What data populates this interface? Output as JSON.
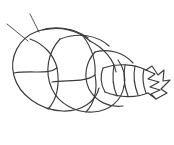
{
  "page": {
    "title": "Snail shell line drawing",
    "subject": "spiral snail shell",
    "style": "black and white line art coloring page",
    "width": 174,
    "height": 145
  },
  "colors": {
    "background": "#ffffff",
    "line": "#3b3b3b",
    "line_light": "#4a4a4a",
    "fill": "#ffffff"
  },
  "drawing": {
    "bounds": {
      "x": 5,
      "y": 14,
      "width": 163,
      "height": 101
    },
    "parts": [
      {
        "name": "antenna-upper",
        "description": "thin tendril from top of shell angling up-right"
      },
      {
        "name": "antenna-lower",
        "description": "thin tendril from upper-left of shell angling up-left"
      },
      {
        "name": "outer-whorl",
        "description": "large rounded left whorl of the shell"
      },
      {
        "name": "second-whorl",
        "description": "overlapping middle spiral band"
      },
      {
        "name": "third-whorl",
        "description": "inner spiral band to the right"
      },
      {
        "name": "tapering-tube",
        "description": "narrow segmented tube tapering to the right"
      },
      {
        "name": "jagged-opening",
        "description": "zigzag toothed opening at the right tip"
      }
    ],
    "segment_line_count": 12,
    "zigzag_tooth_count": 5,
    "antenna_count": 2
  },
  "geometry": {
    "antenna_upper": "M 39 32 L 30 14",
    "antenna_lower": "M 28 41 L 7 24",
    "outer_whorl": "M 38 31 C 18 38 9 58 14 76 C 19 95 40 110 62 111 C 82 112 96 101 99 88",
    "outer_whorl_back": "M 38 31 C 55 25 75 28 88 38",
    "whorl_seg_1": "M 30 39 C 44 44 54 55 57 68",
    "whorl_seg_2": "M 14 73 C 32 70 48 75 57 68",
    "whorl_seg_3": "M 57 68 C 60 84 57 100 48 109",
    "whorl_top_arc": "M 43 30 C 60 26 78 30 90 41",
    "band2_outer": "M 60 39 C 48 52 44 72 52 89 C 59 104 76 113 93 112 C 110 111 122 100 124 86",
    "band2_inner": "M 90 41 C 104 48 114 60 116 72",
    "band2_top": "M 60 39 C 78 32 97 35 109 46",
    "band2_seg_1": "M 83 36 C 92 48 96 62 95 75",
    "band2_seg_2": "M 52 82 C 70 80 86 82 95 75",
    "band2_seg_3": "M 95 75 C 98 90 94 104 86 112",
    "band3_outer": "M 95 52 C 86 62 83 76 89 89 C 96 102 110 108 123 106",
    "band3_top": "M 95 52 C 110 48 124 53 133 63",
    "band3_inner": "M 118 60 C 124 68 126 78 124 87",
    "tube_top": "M 103 68 C 118 63 134 64 146 70",
    "tube_bottom": "M 105 92 C 120 98 136 98 148 93",
    "tube_left": "M 103 68 C 100 76 101 85 105 92",
    "tube_rib_1": "M 114 65 C 112 76 113 87 117 96",
    "tube_rib_2": "M 125 65 C 123 76 124 86 128 96",
    "tube_rib_3": "M 135 66 C 133 76 134 85 138 95",
    "tube_rib_4": "M 144 69 C 142 77 143 85 146 93",
    "zigzag": "M 146 70 L 155 74 L 148 79 L 159 82 L 150 87 L 160 90 L 151 94 L 156 99 L 148 93",
    "zigzag_outer": "M 146 70 L 152 66 L 158 75 L 164 70 L 163 81 L 170 80 L 161 89 L 167 93 L 156 99"
  }
}
